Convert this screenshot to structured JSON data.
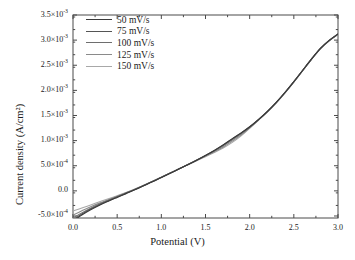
{
  "chart_data": {
    "type": "line",
    "title": "",
    "xlabel": "Potential (V)",
    "ylabel": "Current density (A/cm²)",
    "xlim": [
      0.0,
      3.0
    ],
    "ylim": [
      -0.00054,
      0.0035
    ],
    "grid": false,
    "legend_position": "top-left inside axes",
    "xticks": [
      0.0,
      0.5,
      1.0,
      1.5,
      2.0,
      2.5,
      3.0
    ],
    "xtick_labels": [
      "0.0",
      "0.5",
      "1.0",
      "1.5",
      "2.0",
      "2.5",
      "3.0"
    ],
    "yticks": [
      -0.0005,
      0.0,
      0.0005,
      0.001,
      0.0015,
      0.002,
      0.0025,
      0.003,
      0.0035
    ],
    "ytick_labels": [
      {
        "mantissa": "-5.0×10",
        "exponent": "-4"
      },
      {
        "mantissa": "0.0",
        "exponent": ""
      },
      {
        "mantissa": "5.0×10",
        "exponent": "-4"
      },
      {
        "mantissa": "1.0×10",
        "exponent": "-3"
      },
      {
        "mantissa": "1.5×10",
        "exponent": "-3"
      },
      {
        "mantissa": "2.0×10",
        "exponent": "-3"
      },
      {
        "mantissa": "2.5×10",
        "exponent": "-3"
      },
      {
        "mantissa": "3.0×10",
        "exponent": "-3"
      },
      {
        "mantissa": "3.5×10",
        "exponent": "-3"
      }
    ],
    "x": [
      0.0,
      0.1,
      0.2,
      0.3,
      0.4,
      0.5,
      0.6,
      0.7,
      0.8,
      0.9,
      1.0,
      1.1,
      1.2,
      1.3,
      1.4,
      1.5,
      1.6,
      1.7,
      1.8,
      1.9,
      2.0,
      2.1,
      2.2,
      2.3,
      2.4,
      2.5,
      2.6,
      2.7,
      2.8,
      2.9,
      3.0
    ],
    "series": [
      {
        "name": "50 mV/s",
        "color": "#3a3a3a",
        "values": [
          -0.0006,
          -0.00048,
          -0.000375,
          -0.000285,
          -0.000205,
          -0.00013,
          -5.5e-05,
          2e-05,
          0.0001,
          0.00018,
          0.000265,
          0.00035,
          0.000435,
          0.00052,
          0.00061,
          0.000705,
          0.000805,
          0.000915,
          0.001035,
          0.00115,
          0.001275,
          0.00142,
          0.00158,
          0.00176,
          0.00196,
          0.002175,
          0.0024,
          0.002625,
          0.002835,
          0.002995,
          0.003125
        ]
      },
      {
        "name": "75 mV/s",
        "color": "#555555",
        "values": [
          -0.000575,
          -0.000462,
          -0.000362,
          -0.000275,
          -0.000197,
          -0.000124,
          -5e-05,
          2.5e-05,
          0.000104,
          0.000184,
          0.000268,
          0.000353,
          0.000438,
          0.000523,
          0.000612,
          0.000706,
          0.000804,
          0.000912,
          0.00103,
          0.001146,
          0.001272,
          0.001418,
          0.001578,
          0.001758,
          0.001958,
          0.002173,
          0.002398,
          0.002623,
          0.002833,
          0.002993,
          0.003122
        ]
      },
      {
        "name": "100 mV/s",
        "color": "#6e6e6e",
        "values": [
          -0.00054,
          -0.000438,
          -0.000345,
          -0.000262,
          -0.000188,
          -0.000117,
          -4.5e-05,
          2.9e-05,
          0.000107,
          0.000187,
          0.00027,
          0.000354,
          0.000439,
          0.000524,
          0.000611,
          0.000702,
          0.000796,
          0.000898,
          0.001012,
          0.001132,
          0.001265,
          0.001414,
          0.001575,
          0.001755,
          0.001955,
          0.00217,
          0.002396,
          0.002621,
          0.002831,
          0.002991,
          0.003118
        ]
      },
      {
        "name": "125 mV/s",
        "color": "#8a8a8a",
        "values": [
          -0.00048,
          -0.000398,
          -0.000318,
          -0.000244,
          -0.000175,
          -0.000108,
          -3.9e-05,
          3.3e-05,
          0.00011,
          0.00019,
          0.000272,
          0.000355,
          0.000439,
          0.000522,
          0.000606,
          0.000692,
          0.00078,
          0.000875,
          0.000985,
          0.00111,
          0.001255,
          0.00141,
          0.001572,
          0.001752,
          0.001952,
          0.002167,
          0.002393,
          0.002618,
          0.002828,
          0.002988,
          0.003115
        ]
      },
      {
        "name": "150 mV/s",
        "color": "#a8a8a8",
        "values": [
          -0.0004,
          -0.000342,
          -0.00028,
          -0.000218,
          -0.000157,
          -9.6e-05,
          -3.2e-05,
          3.7e-05,
          0.000113,
          0.000192,
          0.000273,
          0.000355,
          0.000437,
          0.000518,
          0.000598,
          0.00068,
          0.000763,
          0.000853,
          0.00096,
          0.00109,
          0.001245,
          0.001405,
          0.001568,
          0.001748,
          0.001948,
          0.002164,
          0.00239,
          0.002615,
          0.002825,
          0.002985,
          0.003112
        ]
      }
    ]
  },
  "style": {
    "axis_color": "#4a4a4a",
    "text_color": "#1a1a1a",
    "background": "#ffffff"
  }
}
